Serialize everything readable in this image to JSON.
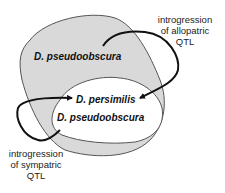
{
  "diagram": {
    "colors": {
      "allopatric_region_fill": "#d9d9d9",
      "sympatric_region_fill": "#ffffff",
      "outline": "#555555",
      "arrow": "#111111"
    },
    "regions": [
      {
        "id": "allopatric",
        "species_label": "D. pseudoobscura"
      },
      {
        "id": "sympatric",
        "species_labels": [
          "D. persimilis",
          "D. pseudoobscura"
        ]
      }
    ],
    "annotations": {
      "allopatric": {
        "line1": "introgression",
        "line2": "of allopatric",
        "line3": "QTL"
      },
      "sympatric": {
        "line1": "introgression",
        "line2": "of sympatric",
        "line3": "QTL"
      }
    }
  }
}
